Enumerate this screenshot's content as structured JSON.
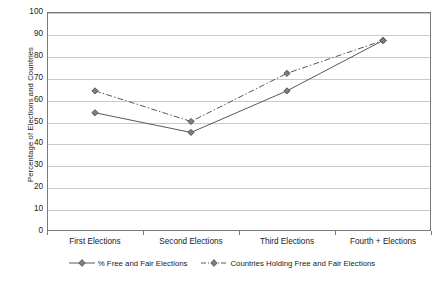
{
  "chart_data": {
    "type": "line",
    "title": "",
    "xlabel": "",
    "ylabel": "Percentage of Elections and Countries",
    "ylim": [
      0,
      100
    ],
    "ytick_step": 10,
    "yticks": [
      "100",
      "90",
      "80",
      "70",
      "60",
      "50",
      "40",
      "30",
      "20",
      "10",
      "0"
    ],
    "grid": true,
    "legend_position": "bottom-center",
    "categories": [
      "First Elections",
      "Second Elections",
      "Third Elections",
      "Fourth + Elections"
    ],
    "series": [
      {
        "name": "% Free and Fair Elections",
        "values": [
          54,
          45,
          64,
          87
        ],
        "line_style": "solid",
        "marker": "diamond",
        "color": "#595959"
      },
      {
        "name": "Countries Holding Free and Fair Elections",
        "values": [
          64,
          50,
          72,
          87
        ],
        "line_style": "dash-dot",
        "marker": "diamond",
        "color": "#595959"
      }
    ]
  },
  "legend": {
    "entries": [
      {
        "label": "% Free and Fair Elections"
      },
      {
        "label": "Countries Holding Free and Fair Elections"
      }
    ]
  },
  "colors": {
    "background": "#ffffff",
    "plot_border": "#7a7a7a",
    "gridline": "#c9c9c9",
    "series_line": "#595959",
    "marker_fill": "#7f7f7f",
    "text": "#1a1a1a"
  }
}
